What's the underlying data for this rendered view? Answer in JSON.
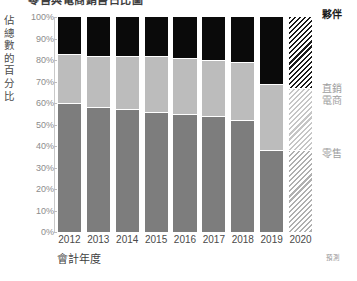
{
  "chart_data": {
    "type": "bar",
    "subtype": "stacked-percentage",
    "title": "零售與電商銷售占比圖",
    "xlabel": "會計年度",
    "ylabel": "佔總數的百分比",
    "ylim": [
      0,
      100
    ],
    "grid": false,
    "legend_position": "right",
    "forecast_note": "預測",
    "forecast_category": "2020",
    "categories": [
      "2012",
      "2013",
      "2014",
      "2015",
      "2016",
      "2017",
      "2018",
      "2019",
      "2020"
    ],
    "y_ticks": [
      "0%",
      "10%",
      "20%",
      "30%",
      "40%",
      "50%",
      "60%",
      "70%",
      "80%",
      "90%",
      "100%"
    ],
    "y_tick_values": [
      0,
      10,
      20,
      30,
      40,
      50,
      60,
      70,
      80,
      90,
      100
    ],
    "series": [
      {
        "name": "零售",
        "key": "retail",
        "color": "#7d7d7d",
        "values": [
          60,
          58,
          57,
          56,
          55,
          54,
          52,
          38,
          38
        ]
      },
      {
        "name": "直銷電商",
        "key": "direct",
        "color": "#bcbcbc",
        "values": [
          23,
          24,
          25,
          26,
          26,
          26,
          27,
          31,
          29
        ]
      },
      {
        "name": "夥伴",
        "key": "partners",
        "color": "#0a0a0a",
        "values": [
          17,
          18,
          18,
          18,
          19,
          20,
          21,
          31,
          33
        ]
      }
    ]
  },
  "legend": {
    "partners": "夥伴",
    "direct_line1": "直銷",
    "direct_line2": "電商",
    "retail": "零售"
  }
}
